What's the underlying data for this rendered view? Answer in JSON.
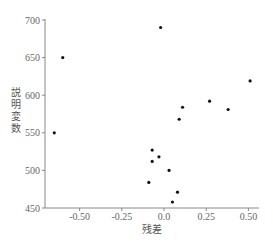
{
  "chart_data": {
    "type": "scatter",
    "title": "",
    "xlabel": "残差",
    "ylabel": "説明変数",
    "xlim": [
      -0.68,
      0.55
    ],
    "ylim": [
      450,
      700
    ],
    "xticks": [
      -0.5,
      -0.25,
      0.0,
      0.25,
      0.5
    ],
    "xtick_labels": [
      "-0.50",
      "-0.25",
      "0.0",
      "0.25",
      "0.50"
    ],
    "yticks": [
      450,
      500,
      550,
      600,
      650,
      700
    ],
    "ytick_labels": [
      "450",
      "500",
      "550",
      "600",
      "650",
      "700"
    ],
    "grid": false,
    "legend": null,
    "points": [
      {
        "x": -0.65,
        "y": 550
      },
      {
        "x": -0.6,
        "y": 650
      },
      {
        "x": -0.02,
        "y": 690
      },
      {
        "x": -0.07,
        "y": 527
      },
      {
        "x": -0.07,
        "y": 512
      },
      {
        "x": -0.03,
        "y": 518
      },
      {
        "x": -0.09,
        "y": 484
      },
      {
        "x": 0.03,
        "y": 500
      },
      {
        "x": 0.08,
        "y": 471
      },
      {
        "x": 0.05,
        "y": 458
      },
      {
        "x": 0.09,
        "y": 568
      },
      {
        "x": 0.11,
        "y": 584
      },
      {
        "x": 0.27,
        "y": 592
      },
      {
        "x": 0.38,
        "y": 581
      },
      {
        "x": 0.51,
        "y": 619
      }
    ]
  },
  "axes": {
    "xlabel": "残差",
    "ylabel_chars": [
      "説",
      "明",
      "変",
      "数"
    ]
  }
}
